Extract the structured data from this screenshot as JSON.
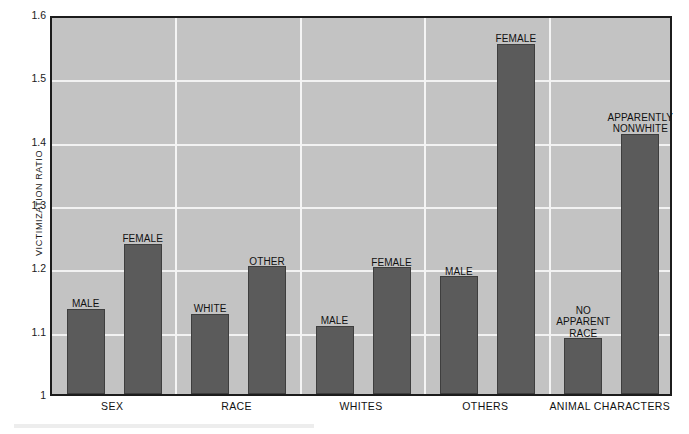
{
  "chart_data": {
    "type": "bar",
    "title": "",
    "xlabel": "",
    "ylabel": "VICTIMIZATION RATIO",
    "ylim": [
      1,
      1.6
    ],
    "ytick_labels": [
      "1.6",
      "1.5",
      "1.4",
      "1.3",
      "1.2",
      "1.1",
      "1"
    ],
    "ytick_values": [
      1.6,
      1.5,
      1.4,
      1.3,
      1.2,
      1.1,
      1.0
    ],
    "grid": true,
    "legend": "none",
    "categories": [
      "SEX",
      "RACE",
      "WHITES",
      "OTHERS",
      "ANIMAL CHARACTERS"
    ],
    "groups": [
      {
        "category": "SEX",
        "bars": [
          {
            "label": "MALE",
            "value": 1.135
          },
          {
            "label": "FEMALE",
            "value": 1.237
          }
        ]
      },
      {
        "category": "RACE",
        "bars": [
          {
            "label": "WHITE",
            "value": 1.127
          },
          {
            "label": "OTHER",
            "value": 1.202
          }
        ]
      },
      {
        "category": "WHITES",
        "bars": [
          {
            "label": "MALE",
            "value": 1.108
          },
          {
            "label": "FEMALE",
            "value": 1.2
          }
        ]
      },
      {
        "category": "OTHERS",
        "bars": [
          {
            "label": "MALE",
            "value": 1.186
          },
          {
            "label": "FEMALE",
            "value": 1.553
          }
        ]
      },
      {
        "category": "ANIMAL CHARACTERS",
        "bars": [
          {
            "label": "NO\nAPPARENT\nRACE",
            "value": 1.088
          },
          {
            "label": "APPARENTLY\nNONWHITE",
            "value": 1.411
          }
        ]
      }
    ],
    "colors": {
      "bar_fill": "#5b5b5b",
      "plot_background": "#c3c3c3",
      "gridline": "#f2f2f2",
      "axis": "#1c1c1c",
      "text": "#111111",
      "page_background": "#ffffff"
    }
  }
}
